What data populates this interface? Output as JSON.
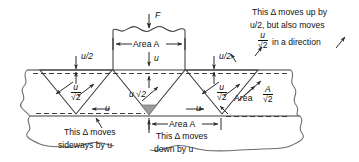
{
  "figure": {
    "force_label": "F",
    "area_label_top": "Area A",
    "area_label_bottom": "Area A",
    "area_label_right_prefix": "Area",
    "area_right_numerator": "A",
    "area_right_denominator": "√2",
    "u_half_left": "u/2",
    "u_half_right": "u/2",
    "u_center_top": "u",
    "u_left_horizontal": "u",
    "u_right_horizontal": "u",
    "u_sqrt2_center": "u √2",
    "frac_left_numerator": "u",
    "frac_left_denominator": "√2",
    "frac_right_numerator": "u",
    "frac_right_denominator": "√2",
    "note_left_line1": "This Δ moves",
    "note_left_line2": "sideways by u",
    "note_center_line1": "This Δ moves",
    "note_center_line2": "down by u",
    "note_right_line1": "This Δ moves up by",
    "note_right_line2": "u/2, but also moves",
    "note_right_numerator": "u",
    "note_right_denominator": "√2",
    "note_right_line3_tail": "in a direction",
    "colors": {
      "stroke": "#3c3c3c",
      "text": "#111111",
      "fill_gray": "#9a9a9a",
      "background": "#ffffff"
    }
  }
}
